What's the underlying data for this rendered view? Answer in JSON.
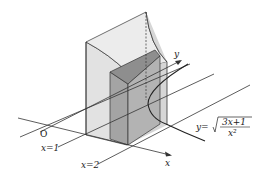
{
  "diagram": {
    "labels": {
      "y_axis": "y",
      "x_axis": "x",
      "origin": "O",
      "x1": "x=1",
      "x2": "x=2",
      "curve_lhs": "y=",
      "curve_num": "3x+1",
      "curve_den": "x²"
    },
    "colors": {
      "face_light": "#e4e4e4",
      "face_mid": "#d0d0d0",
      "face_dark": "#9a9a9a",
      "face_top": "#eeeeee",
      "line": "#333333"
    }
  }
}
